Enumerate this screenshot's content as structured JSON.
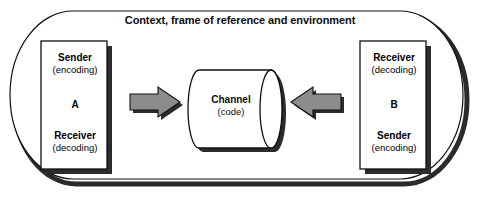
{
  "diagram": {
    "type": "communication-model",
    "environment": {
      "label": "Context, frame of reference and environment",
      "shape": "rounded-rectangle"
    },
    "colors": {
      "stroke": "#111111",
      "box_fill": "#ffffff",
      "shadow": "#2b2b2b",
      "arrow_fill": "#8c8c8c",
      "arrow_stroke": "#111111",
      "text": "#0d0d0d",
      "page_background": "#ffffff"
    },
    "left_party": {
      "name": "left-participant",
      "letter": "A",
      "top_role": {
        "role": "Sender",
        "mode": "(encoding)"
      },
      "bottom_role": {
        "role": "Receiver",
        "mode": "(decoding)"
      }
    },
    "right_party": {
      "name": "right-participant",
      "letter": "B",
      "top_role": {
        "role": "Receiver",
        "mode": "(decoding)"
      },
      "bottom_role": {
        "role": "Sender",
        "mode": "(encoding)"
      }
    },
    "channel": {
      "name": "Channel",
      "sub": "(code)",
      "shape": "cylinder"
    },
    "arrows": [
      {
        "name": "arrow-a-to-channel",
        "direction": "right",
        "from": "A",
        "to": "Channel"
      },
      {
        "name": "arrow-b-to-channel",
        "direction": "left",
        "from": "B",
        "to": "Channel"
      }
    ]
  }
}
